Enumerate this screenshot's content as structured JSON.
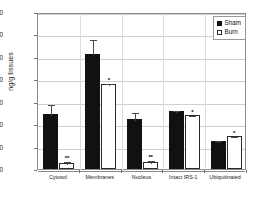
{
  "chart_data": {
    "type": "bar",
    "title": "",
    "xlabel": "",
    "ylabel": "ng/g tissues",
    "ylim": [
      0,
      140
    ],
    "yticks": [
      0,
      20,
      40,
      60,
      80,
      100,
      120,
      140
    ],
    "grid": true,
    "legend_position": "top-right",
    "categories": [
      "Cytosol",
      "Membranes",
      "Nucleus",
      "Intact IRS-1",
      "Ubiquitinated"
    ],
    "series": [
      {
        "name": "Sham",
        "color": "#111111",
        "values": [
          49,
          103,
          45,
          52,
          25
        ],
        "errors": [
          10,
          14,
          7,
          1.5,
          1.5
        ],
        "annotations": [
          "",
          "",
          "",
          "",
          ""
        ]
      },
      {
        "name": "Burn",
        "color": "#ffffff",
        "values": [
          5,
          76,
          6,
          48,
          29
        ],
        "errors": [
          3,
          2,
          3,
          1,
          1
        ],
        "annotations": [
          "**",
          "*",
          "**",
          "*",
          "*"
        ]
      }
    ]
  },
  "axis": {
    "y_label": "ng/g tissues",
    "y_tick_labels": [
      "140",
      "120",
      "100",
      "80",
      "60",
      "40",
      "20",
      "0"
    ],
    "x_tick_labels": [
      "Cytosol",
      "Membranes",
      "Nucleus",
      "Intact IRS-1",
      "Ubiquitinated"
    ]
  },
  "legend": {
    "items": [
      {
        "label": "Sham",
        "swatch": "filled-square"
      },
      {
        "label": "Burn",
        "swatch": "open-square"
      }
    ]
  }
}
